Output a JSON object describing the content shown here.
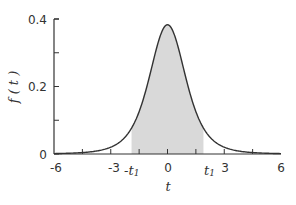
{
  "chart_data": {
    "type": "line",
    "title": "",
    "xlabel": "t",
    "ylabel": "f ( t )",
    "xlim": [
      -6,
      6
    ],
    "ylim": [
      0,
      0.4
    ],
    "x_ticks": [
      -6,
      -3,
      0,
      3,
      6
    ],
    "x_tick_labels": [
      "-6",
      "-3",
      "0",
      "3",
      "6"
    ],
    "x_minor_ticks": [
      -4.5,
      -3,
      -1.5,
      0,
      1.5,
      3,
      4.5
    ],
    "y_ticks": [
      0,
      0.1,
      0.2,
      0.3,
      0.4
    ],
    "y_tick_labels": [
      "0",
      "0.2",
      "0.4"
    ],
    "grid": false,
    "series": [
      {
        "name": "t-distribution density f(t)",
        "x": [
          -6,
          -5,
          -4,
          -3,
          -2.5,
          -2,
          -1.5,
          -1,
          -0.5,
          0,
          0.5,
          1,
          1.5,
          2,
          2.5,
          3,
          4,
          5,
          6
        ],
        "values": [
          0.003,
          0.006,
          0.012,
          0.027,
          0.044,
          0.07,
          0.12,
          0.22,
          0.33,
          0.383,
          0.33,
          0.22,
          0.12,
          0.07,
          0.044,
          0.027,
          0.012,
          0.006,
          0.003
        ]
      }
    ],
    "shaded_region": {
      "from": -1.9,
      "to": 1.9,
      "color": "#d9d9d9"
    },
    "annotations": [
      {
        "text": "-t₁",
        "x": -1.9
      },
      {
        "text": "t₁",
        "x": 1.9
      }
    ]
  },
  "labels": {
    "y_axis": "f ( t )",
    "x_axis": "t",
    "neg_t1": "-t",
    "pos_t1": "t",
    "subscript": "1",
    "y0": "0",
    "y02": "0.2",
    "y04": "0.4",
    "xm6": "-6",
    "xm3": "-3",
    "x0": "0",
    "x3": "3",
    "x6": "6"
  },
  "colors": {
    "curve": "#333333",
    "shade": "#d9d9d9",
    "axis": "#333333"
  }
}
